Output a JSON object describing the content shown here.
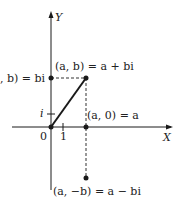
{
  "diagram": {
    "axes": {
      "x_label": "X",
      "y_label": "Y",
      "origin_label": "0",
      "x_tick_label": "1",
      "y_tick_label": "i"
    },
    "points": {
      "z": {
        "label": "(a, b) = a + bi"
      },
      "imag": {
        "label": ", b) = bi"
      },
      "real": {
        "label": "(a, 0) = a"
      },
      "conj": {
        "label": "(a, −b) = a − bi"
      }
    },
    "colors": {
      "line": "#1a1a1a",
      "dashed": "#333333"
    }
  }
}
